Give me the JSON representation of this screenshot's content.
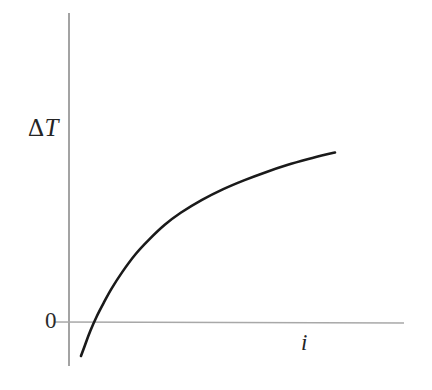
{
  "figure": {
    "background_color": "#ffffff",
    "curve_color": "#1a1a1a",
    "axis_color": "#8c8c8c",
    "text_color": "#242424"
  },
  "labels": {
    "y_axis_delta": "Δ",
    "y_axis_symbol": "T",
    "x_axis": "i",
    "origin": "0"
  },
  "chart_data": {
    "type": "line",
    "title": "",
    "xlabel": "i",
    "ylabel": "ΔT",
    "grid": false,
    "legend": false,
    "axes": {
      "x_axis_kind": "arrow-less ruled line",
      "y_axis_kind": "arrow-less ruled line",
      "origin_tick_label": "0",
      "x_ticks": [],
      "y_ticks": [],
      "xlim": [
        0,
        1
      ],
      "ylim": [
        -0.18,
        1.0
      ]
    },
    "annotations": [
      {
        "text": "ΔT",
        "role": "y-axis-label"
      },
      {
        "text": "i",
        "role": "x-axis-label"
      },
      {
        "text": "0",
        "role": "origin-label"
      }
    ],
    "series": [
      {
        "name": "ΔT vs i",
        "description": "Monotonically increasing concave curve starting below zero, crossing zero at small i and saturating at large i",
        "x": [
          0.045,
          0.06,
          0.08,
          0.105,
          0.13,
          0.16,
          0.2,
          0.25,
          0.3,
          0.36,
          0.42,
          0.5,
          0.58,
          0.66,
          0.74,
          0.82,
          0.9,
          0.97,
          1.0
        ],
        "y": [
          -0.158,
          -0.108,
          -0.042,
          0.028,
          0.088,
          0.155,
          0.232,
          0.315,
          0.382,
          0.452,
          0.508,
          0.568,
          0.618,
          0.66,
          0.697,
          0.73,
          0.758,
          0.78,
          0.788
        ]
      }
    ]
  }
}
